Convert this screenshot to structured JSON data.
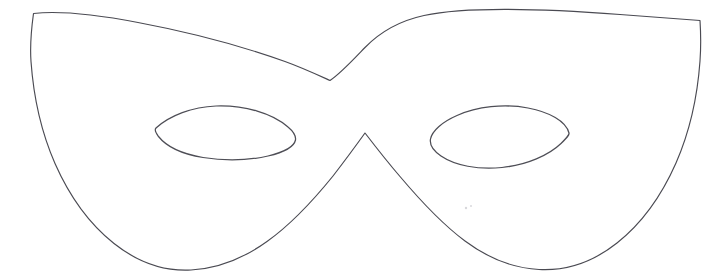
{
  "document": {
    "title": "Masquerade Mask Outline",
    "kind": "line-drawing",
    "subject": "carnival eye mask template",
    "background_color": "#ffffff",
    "stroke_color": "#4a4a52",
    "fill_color": "#ffffff",
    "stroke_width_px": 1.15,
    "canvas": {
      "width": 722,
      "height": 280
    }
  },
  "shapes": {
    "mask_outline": {
      "name": "mask-outline",
      "description": "Closed outline of a masquerade eye mask with pointed upper corners, a V-shaped notch at the centre brow and two rounded lower lobes meeting at a central peak.",
      "path": "M 33.5 13.5 C 60 10.5 96 14.5 138 22.5 C 186 31.5 243 46.5 285 61.5 C 303 68 319 75.5 330 80.5 C 340 74 352 61 365 47.5 C 381 31 401 20.5 424 15.5 C 466 6.5 540 8.5 620 14.5 C 658 17.5 684 19.5 700 20.5 C 700.8 33 701 47 700 61 C 697.5 96 690 131 676 163 C 661 197 641 224 617 243 C 593 262 566 271 539 269.5 C 512 268 487 257.5 465 241 C 440 222.5 419 199 400 176.5 C 387 161.5 375 146 365 133 C 356 145.5 345 160.5 333 176 C 314 199.5 293 223 267 241.5 C 244 258 218 268.5 191 270 C 164 271.5 138 262.5 114 243.5 C 90 224.5 70 197.5 55 163.5 C 41 131.5 33.5 96.5 31 61.5 C 30 47.5 31.5 28 33.5 13.5 Z"
    },
    "eye_left": {
      "name": "eye-hole-left",
      "description": "Almond shaped left eye opening, tilted slightly up toward the centre.",
      "path": "M 156 128 C 170 115.5 192 107 216 106 C 244 105 272 113 288 127 C 294 132 296 136.5 295.5 140 C 294 147 283 152.5 268 156 C 248 160.5 224 161 203 157.5 C 182 154 166 146 158.5 136.5 C 155.5 132.5 154.5 129.5 156 128 Z"
    },
    "eye_right": {
      "name": "eye-hole-right",
      "description": "Almond shaped right eye opening, mirrored from the left eye.",
      "path": "M 569 133 C 566 121 549 112 528 108 C 504 103.5 477 106.5 457 115.5 C 442 122 432 131 430.5 139 C 429.5 144.5 433 150.5 441 156 C 455 165.5 478 170 502 167.5 C 527 165 549 155 561 143.5 C 567 137.5 569.5 135 569 133 Z"
    }
  },
  "marks": {
    "specks": [
      {
        "name": "scan-speck-1",
        "x": 466,
        "y": 208,
        "r": 1.2
      },
      {
        "name": "scan-speck-2",
        "x": 471,
        "y": 206,
        "r": 1.0
      }
    ]
  }
}
